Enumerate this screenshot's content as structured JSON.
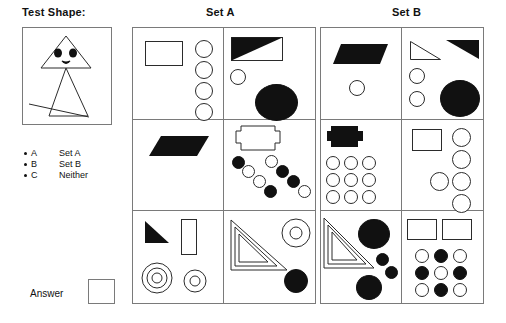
{
  "page": {
    "test_shape_label": "Test Shape:",
    "set_a_header": "Set A",
    "set_b_header": "Set B",
    "answer_label": "Answer",
    "line_color": "#7a7a7a",
    "fill_black": "#111111",
    "fill_white": "#ffffff"
  },
  "legend": {
    "rows": [
      {
        "key": "A",
        "value": "Set A"
      },
      {
        "key": "B",
        "value": "Set B"
      },
      {
        "key": "C",
        "value": "Neither"
      }
    ]
  },
  "test_shape": {
    "description": "small triangle head with two black dot eyes and a small mouth above a tall narrow triangle body crossed by a long thin line",
    "parts": [
      "head-triangle-outline",
      "eye-dot-left",
      "eye-dot-right",
      "mouth-shape",
      "body-triangle-outline",
      "crossing-line"
    ]
  },
  "set_a": {
    "cells": [
      {
        "id": "a-r1c1",
        "shapes": [
          "white-rectangle",
          "white-circle",
          "white-circle",
          "white-circle",
          "white-circle"
        ]
      },
      {
        "id": "a-r1c2",
        "shapes": [
          "half-black-diagonal-rectangle",
          "small-white-circle",
          "large-black-circle"
        ]
      },
      {
        "id": "a-r2c1",
        "shapes": [
          "black-parallelogram"
        ]
      },
      {
        "id": "a-r2c2",
        "shapes": [
          "white-tabbed-rectangle",
          "black-circle",
          "white-circle",
          "white-circle",
          "black-circle",
          "white-circle",
          "black-circle",
          "black-circle",
          "white-circle"
        ]
      },
      {
        "id": "a-r3c1",
        "shapes": [
          "black-right-triangle",
          "white-tall-rectangle",
          "triple-concentric-circle",
          "double-concentric-circle"
        ]
      },
      {
        "id": "a-r3c2",
        "shapes": [
          "nested-triangles-outline",
          "donut-circle",
          "black-circle"
        ]
      }
    ]
  },
  "set_b": {
    "cells": [
      {
        "id": "b-r1c1",
        "shapes": [
          "black-parallelogram",
          "small-white-circle"
        ]
      },
      {
        "id": "b-r1c2",
        "shapes": [
          "white-right-triangle",
          "black-right-triangle",
          "small-white-circle",
          "small-white-circle",
          "large-black-circle"
        ]
      },
      {
        "id": "b-r2c1",
        "shapes": [
          "black-tabbed-rectangle",
          "white-circle-grid-3x3"
        ]
      },
      {
        "id": "b-r2c2",
        "shapes": [
          "white-rectangle",
          "white-circle",
          "white-circle",
          "white-circle",
          "white-circle",
          "white-circle"
        ]
      },
      {
        "id": "b-r3c1",
        "shapes": [
          "nested-triangles-outline",
          "large-black-circle",
          "small-black-circle",
          "small-black-circle",
          "large-black-circle"
        ]
      },
      {
        "id": "b-r3c2",
        "shapes": [
          "white-rectangle",
          "white-rectangle",
          "checkered-circle-grid-3x3"
        ]
      }
    ]
  }
}
